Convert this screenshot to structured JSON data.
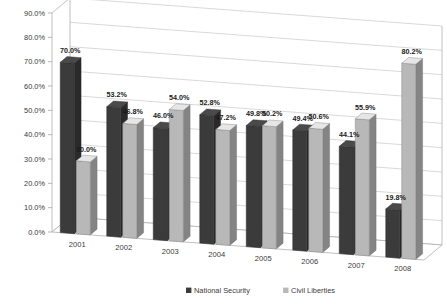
{
  "chart_data": {
    "type": "bar",
    "title": "",
    "subtitle": "",
    "xlabel": "",
    "ylabel": "",
    "categories": [
      "2001",
      "2002",
      "2003",
      "2004",
      "2005",
      "2006",
      "2007",
      "2008"
    ],
    "series": [
      {
        "name": "National Security",
        "color": "#3b3b3b",
        "values": [
          70.0,
          53.2,
          46.0,
          52.8,
          49.8,
          49.4,
          44.1,
          19.8
        ],
        "labels": [
          "70.0%",
          "53.2%",
          "46.0%",
          "52.8%",
          "49.8%",
          "49.4%",
          "44.1%",
          "19.8%"
        ]
      },
      {
        "name": "Civil Liberties",
        "color": "#b8b8b8",
        "values": [
          30.0,
          46.8,
          54.0,
          47.2,
          50.2,
          50.6,
          55.9,
          80.2
        ],
        "labels": [
          "30.0%",
          "46.8%",
          "54.0%",
          "47.2%",
          "50.2%",
          "50.6%",
          "55.9%",
          "80.2%"
        ]
      }
    ],
    "ylim": [
      0,
      90
    ],
    "yticks": [
      0,
      10,
      20,
      30,
      40,
      50,
      60,
      70,
      80,
      90
    ],
    "ytick_labels": [
      "0.0%",
      "10.0%",
      "20.0%",
      "30.0%",
      "40.0%",
      "50.0%",
      "60.0%",
      "70.0%",
      "80.0%",
      "90.0%"
    ],
    "grid": true,
    "legend_position": "bottom",
    "style": "3d-column",
    "background": "#ffffff",
    "gridline_color": "#c8c8c8"
  },
  "legend": {
    "items": [
      {
        "label": "National Security",
        "marker": "series-swatch-dark"
      },
      {
        "label": "Civil Liberties",
        "marker": "series-swatch-light"
      }
    ]
  }
}
